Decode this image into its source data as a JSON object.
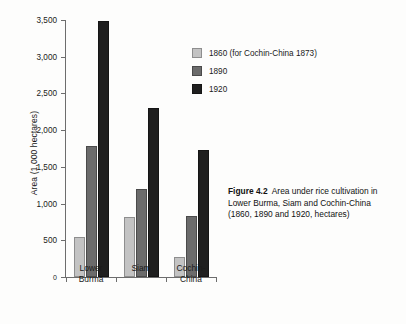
{
  "figure": {
    "caption_label": "Figure 4.2",
    "caption_text": "Area under rice cultivation in Lower Burma, Siam and Cochin-China (1860, 1890 and 1920, hectares)"
  },
  "chart_data": {
    "type": "bar",
    "title": "",
    "subtitle": "",
    "xlabel": "",
    "ylabel": "Area (1,000 hectares)",
    "categories": [
      "Lower Burma",
      "Siam",
      "Cochin-China"
    ],
    "category_lines": [
      [
        "Lower",
        "Burma"
      ],
      [
        "Siam"
      ],
      [
        "Cochin-",
        "China"
      ]
    ],
    "series": [
      {
        "name": "1860 (for Cochin-China 1873)",
        "color": "#c3c3c3",
        "values": [
          550,
          820,
          270
        ]
      },
      {
        "name": "1890",
        "color": "#6b6b6b",
        "values": [
          1790,
          1200,
          830
        ]
      },
      {
        "name": "1920",
        "color": "#1f1f1f",
        "values": [
          3490,
          2300,
          1730
        ]
      }
    ],
    "ylim": [
      0,
      3500
    ],
    "ytick_values": [
      0,
      500,
      1000,
      1500,
      2000,
      2500,
      3000,
      3500
    ],
    "ytick_labels": [
      "0",
      "500",
      "1,000",
      "1,500",
      "2,000",
      "2,500",
      "3,000",
      "3,500"
    ],
    "grid": false,
    "legend_position": "top-right"
  }
}
